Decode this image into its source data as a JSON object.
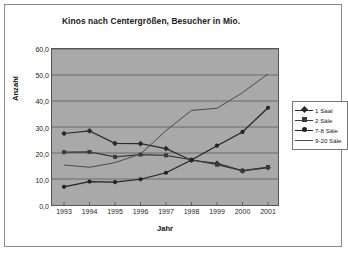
{
  "chart_data": {
    "type": "line",
    "title": "Kinos nach Centergrößen, Besucher in Mio.",
    "xlabel": "Jahr",
    "ylabel": "Anzahl",
    "categories": [
      "1993",
      "1994",
      "1995",
      "1996",
      "1997",
      "1998",
      "1999",
      "2000",
      "2001"
    ],
    "ylim": [
      0,
      60
    ],
    "ytick_labels": [
      "0,0",
      "10,0",
      "20,0",
      "30,0",
      "40,0",
      "50,0",
      "60,0"
    ],
    "ytick_values": [
      0,
      10,
      20,
      30,
      40,
      50,
      60
    ],
    "grid": true,
    "legend_position": "right",
    "plot_background": "#a9a9a9",
    "series": [
      {
        "name": "1 Saal",
        "marker": "diamond",
        "color": "#2b2b2b",
        "values": [
          27.5,
          28.5,
          23.7,
          23.6,
          21.7,
          17.2,
          16.0,
          13.1,
          14.4
        ]
      },
      {
        "name": "2 Säle",
        "marker": "square",
        "color": "#3a3a3a",
        "values": [
          20.3,
          20.4,
          18.5,
          19.4,
          19.1,
          17.4,
          15.5,
          13.2,
          14.6
        ]
      },
      {
        "name": "7-8 Säle",
        "marker": "circle",
        "color": "#222222",
        "values": [
          7.0,
          9.0,
          8.8,
          9.9,
          12.4,
          17.3,
          22.8,
          28.1,
          37.4
        ]
      },
      {
        "name": "9-20 Säle",
        "marker": "none",
        "color": "#4a4a4a",
        "values": [
          15.4,
          14.5,
          16.3,
          19.6,
          28.6,
          36.4,
          37.2,
          43.2,
          50.4
        ]
      }
    ]
  },
  "legend": {
    "items": [
      {
        "label": "1 Saal"
      },
      {
        "label": "2 Säle"
      },
      {
        "label": "7-8 Säle"
      },
      {
        "label": "9-20 Säle"
      }
    ]
  }
}
